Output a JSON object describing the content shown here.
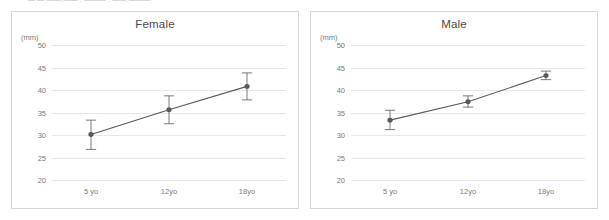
{
  "top_strip": {
    "fragments": [
      {
        "text": "— — ——.——   .  ———   .        ——.———",
        "left": 28
      }
    ]
  },
  "chart_data": [
    {
      "type": "line",
      "title": "Female",
      "xlabel": "",
      "ylabel": "(mm)",
      "unit": "(mm)",
      "categories": [
        "5 yo",
        "12yo",
        "18yo"
      ],
      "values": [
        30.1,
        35.6,
        40.8
      ],
      "error_low": [
        26.8,
        32.5,
        37.8
      ],
      "error_high": [
        33.3,
        38.7,
        43.8
      ],
      "error_minus": [
        3.3,
        3.1,
        3.0
      ],
      "error_plus": [
        3.2,
        3.1,
        3.0
      ],
      "yticks": [
        50,
        45,
        40,
        35,
        30,
        25,
        20
      ],
      "ylim": [
        20,
        50
      ],
      "grid": true,
      "legend": "none",
      "series_color": "#595959"
    },
    {
      "type": "line",
      "title": "Male",
      "xlabel": "",
      "ylabel": "(mm)",
      "unit": "(mm)",
      "categories": [
        "5 yo",
        "12yo",
        "18yo"
      ],
      "values": [
        33.3,
        37.4,
        43.2
      ],
      "error_low": [
        31.2,
        36.2,
        42.3
      ],
      "error_high": [
        35.5,
        38.7,
        44.2
      ],
      "error_minus": [
        2.1,
        1.2,
        0.9
      ],
      "error_plus": [
        2.2,
        1.3,
        1.0
      ],
      "yticks": [
        50,
        45,
        40,
        35,
        30,
        25,
        20
      ],
      "ylim": [
        20,
        50
      ],
      "grid": true,
      "legend": "none",
      "series_color": "#595959"
    }
  ],
  "colors": {
    "series": "#595959",
    "grid": "#e6e6e6",
    "panel_border": "#d6d6d6",
    "tick_text": "#7a7a7a",
    "title_text": "#4a4a4a",
    "background": "#ffffff"
  }
}
